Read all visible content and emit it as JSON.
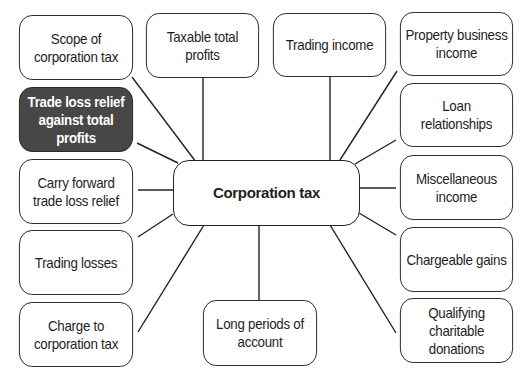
{
  "diagram": {
    "center": {
      "label": "Corporation tax"
    },
    "nodes": [
      {
        "id": "scope",
        "label": "Scope of\ncorporation tax"
      },
      {
        "id": "taxable",
        "label": "Taxable total\nprofits"
      },
      {
        "id": "trading-income",
        "label": "Trading income"
      },
      {
        "id": "property",
        "label": "Property business\nincome"
      },
      {
        "id": "loan",
        "label": "Loan\nrelationships"
      },
      {
        "id": "misc",
        "label": "Miscellaneous\nincome"
      },
      {
        "id": "chargeable",
        "label": "Chargeable gains"
      },
      {
        "id": "qualifying",
        "label": "Qualifying\ncharitable\ndonations"
      },
      {
        "id": "long-periods",
        "label": "Long periods of\naccount"
      },
      {
        "id": "charge",
        "label": "Charge to\ncorporation tax"
      },
      {
        "id": "trading-losses",
        "label": "Trading losses"
      },
      {
        "id": "carry-forward",
        "label": "Carry forward\ntrade loss relief"
      },
      {
        "id": "trade-loss-relief",
        "label": "Trade loss relief\nagainst total\nprofits",
        "highlighted": true
      }
    ],
    "colors": {
      "highlight_fill": "#474747",
      "highlight_text": "#ffffff",
      "border": "#222222",
      "background": "#ffffff"
    }
  }
}
